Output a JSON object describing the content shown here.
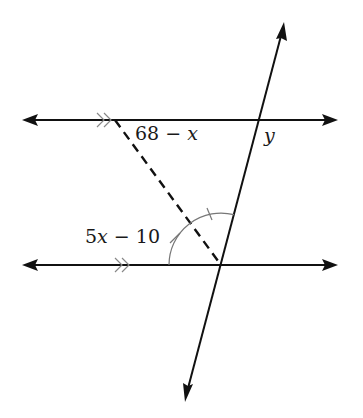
{
  "figure": {
    "type": "geometry",
    "labels": {
      "angle_top": "68 − x",
      "angle_top_parts": {
        "num": "68 − ",
        "var": "x"
      },
      "angle_bottom": "5x − 10",
      "angle_bottom_parts": {
        "num": "5",
        "var": "x",
        "rest": " − 10"
      },
      "angle_y": "y"
    },
    "parallel_markers": "double chevron (>>) on both horizontal lines",
    "congruent_marks": "arc with single tick marks indicating the angle is bisected by the dashed line",
    "colors": {
      "line": "#111111",
      "arc": "#777777",
      "background": "#ffffff"
    }
  }
}
